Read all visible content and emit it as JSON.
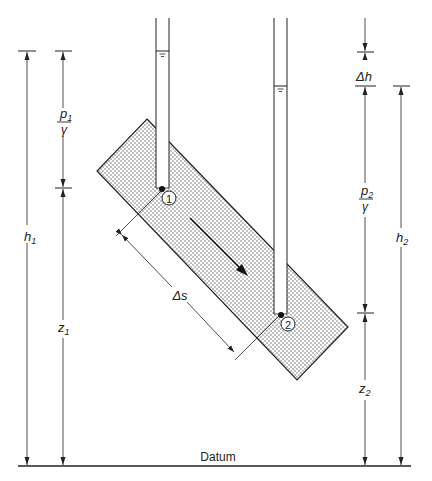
{
  "diagram": {
    "type": "hydraulic head diagram (flow through inclined porous column)",
    "labels": {
      "p1_num": "p",
      "p1_sub": "1",
      "gamma1": "γ",
      "h1_main": "h",
      "h1_sub": "1",
      "z1_main": "z",
      "z1_sub": "1",
      "delta_s": "Δs",
      "point1": "1",
      "point2": "2",
      "delta_h": "Δh",
      "p2_num": "p",
      "p2_sub": "2",
      "gamma2": "γ",
      "h2_main": "h",
      "h2_sub": "2",
      "z2_main": "z",
      "z2_sub": "2",
      "datum": "Datum"
    },
    "elements": [
      "inclined porous medium column (stippled)",
      "piezometer tube 1 with water level",
      "piezometer tube 2 with water level",
      "flow direction arrow",
      "dimension lines: h1, p1/γ, z1, Δh, p2/γ, z2, h2, Δs",
      "datum line"
    ],
    "colors": {
      "line": "#222222",
      "stipple": "#555555",
      "background": "#ffffff"
    }
  }
}
